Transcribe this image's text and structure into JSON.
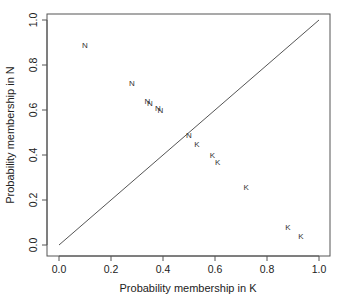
{
  "chart_data": {
    "type": "scatter",
    "title": "",
    "xlabel": "Probability membership in K",
    "ylabel": "Probability membership  in N",
    "xlim": [
      0.0,
      1.0
    ],
    "ylim": [
      0.0,
      1.0
    ],
    "xticks": [
      "0.0",
      "0.2",
      "0.4",
      "0.6",
      "0.8",
      "1.0"
    ],
    "yticks": [
      "0.0",
      "0.2",
      "0.4",
      "0.6",
      "0.8",
      "1.0"
    ],
    "grid": false,
    "legend": null,
    "reference_line": {
      "type": "y=x",
      "from": [
        0.0,
        0.0
      ],
      "to": [
        1.0,
        1.0
      ]
    },
    "points": [
      {
        "label": "N",
        "x": 0.1,
        "y": 0.89
      },
      {
        "label": "N",
        "x": 0.28,
        "y": 0.72
      },
      {
        "label": "N",
        "x": 0.34,
        "y": 0.64
      },
      {
        "label": "N",
        "x": 0.35,
        "y": 0.63
      },
      {
        "label": "N",
        "x": 0.38,
        "y": 0.61
      },
      {
        "label": "N",
        "x": 0.39,
        "y": 0.6
      },
      {
        "label": "N",
        "x": 0.5,
        "y": 0.49
      },
      {
        "label": "K",
        "x": 0.53,
        "y": 0.45
      },
      {
        "label": "K",
        "x": 0.59,
        "y": 0.4
      },
      {
        "label": "K",
        "x": 0.61,
        "y": 0.37
      },
      {
        "label": "K",
        "x": 0.72,
        "y": 0.26
      },
      {
        "label": "K",
        "x": 0.88,
        "y": 0.08
      },
      {
        "label": "K",
        "x": 0.93,
        "y": 0.04
      }
    ]
  },
  "colors": {
    "axis": "#555555",
    "text": "#222222",
    "points": "#333333",
    "background": "#ffffff"
  }
}
